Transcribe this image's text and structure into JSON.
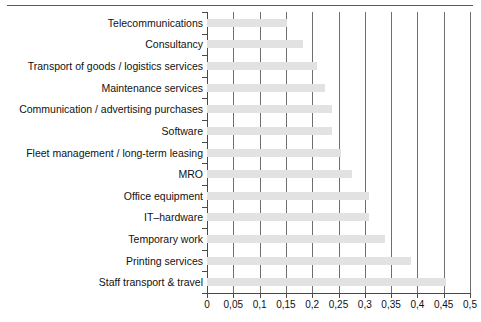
{
  "chart_data": {
    "type": "bar",
    "orientation": "horizontal",
    "title": "",
    "subtitle": "",
    "xlabel": "",
    "ylabel": "",
    "xlim": [
      0,
      0.5
    ],
    "grid": true,
    "legend": false,
    "decimal_separator": ",",
    "categories": [
      "Telecommunications",
      "Consultancy",
      "Transport of goods / logistics services",
      "Maintenance services",
      "Communication / advertising purchases",
      "Software",
      "Fleet management / long-term leasing",
      "MRO",
      "Office equipment",
      "IT–hardware",
      "Temporary work",
      "Printing services",
      "Staff transport & travel"
    ],
    "values": [
      0.152,
      0.183,
      0.209,
      0.224,
      0.238,
      0.238,
      0.255,
      0.276,
      0.308,
      0.308,
      0.338,
      0.388,
      0.455
    ],
    "xticks": [
      0,
      0.05,
      0.1,
      0.15,
      0.2,
      0.25,
      0.3,
      0.35,
      0.4,
      0.45,
      0.5
    ],
    "xticklabels": [
      "0",
      "0,05",
      "0,1",
      "0,15",
      "0,2",
      "0,25",
      "0,3",
      "0,35",
      "0,4",
      "0,45",
      "0,5"
    ],
    "bar_color": "#e2e2e2",
    "axis_color": "#4a4a4a",
    "gridline_color": "#6e6e6e"
  }
}
